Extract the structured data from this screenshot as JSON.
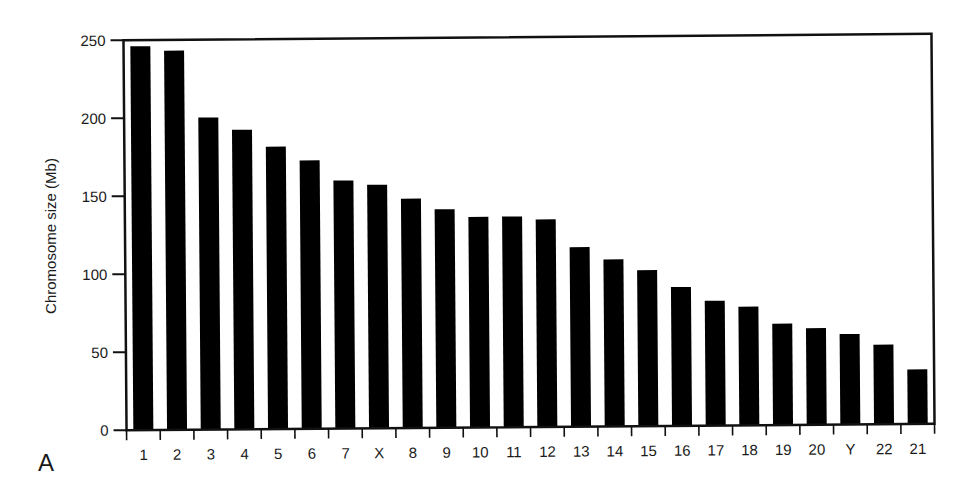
{
  "chart_data": {
    "type": "bar",
    "title": "",
    "panel_label": "A",
    "xlabel": "",
    "ylabel": "Chromosome size (Mb)",
    "ylim": [
      0,
      250
    ],
    "yticks": [
      0,
      50,
      100,
      150,
      200,
      250
    ],
    "grid": false,
    "legend": null,
    "bar_color": "#000000",
    "categories": [
      "1",
      "2",
      "3",
      "4",
      "5",
      "6",
      "7",
      "X",
      "8",
      "9",
      "10",
      "11",
      "12",
      "13",
      "14",
      "15",
      "16",
      "17",
      "18",
      "19",
      "20",
      "Y",
      "22",
      "21"
    ],
    "values": [
      246,
      243,
      200,
      192,
      181,
      172,
      159,
      156,
      147,
      140,
      135,
      135,
      133,
      115,
      107,
      100,
      89,
      80,
      76,
      65,
      62,
      58,
      51,
      35
    ]
  }
}
